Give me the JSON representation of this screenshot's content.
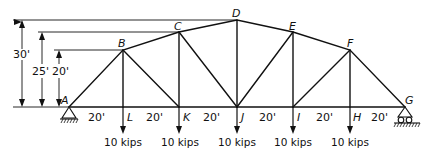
{
  "diagram": {
    "type": "truss",
    "nodes": {
      "A": {
        "label": "A",
        "x": 69,
        "y": 107
      },
      "L": {
        "label": "L",
        "x": 123,
        "y": 107
      },
      "K": {
        "label": "K",
        "x": 179,
        "y": 107
      },
      "J": {
        "label": "J",
        "x": 237,
        "y": 107
      },
      "I": {
        "label": "I",
        "x": 293,
        "y": 107
      },
      "H": {
        "label": "H",
        "x": 350,
        "y": 107
      },
      "G": {
        "label": "G",
        "x": 405,
        "y": 107
      },
      "B": {
        "label": "B",
        "x": 123,
        "y": 50
      },
      "C": {
        "label": "C",
        "x": 179,
        "y": 32
      },
      "D": {
        "label": "D",
        "x": 237,
        "y": 20
      },
      "E": {
        "label": "E",
        "x": 293,
        "y": 32
      },
      "F": {
        "label": "F",
        "x": 350,
        "y": 50
      }
    },
    "members": [
      [
        "A",
        "L"
      ],
      [
        "L",
        "K"
      ],
      [
        "K",
        "J"
      ],
      [
        "J",
        "I"
      ],
      [
        "I",
        "H"
      ],
      [
        "H",
        "G"
      ],
      [
        "A",
        "B"
      ],
      [
        "B",
        "C"
      ],
      [
        "C",
        "D"
      ],
      [
        "D",
        "E"
      ],
      [
        "E",
        "F"
      ],
      [
        "F",
        "G"
      ],
      [
        "B",
        "L"
      ],
      [
        "C",
        "K"
      ],
      [
        "D",
        "J"
      ],
      [
        "E",
        "I"
      ],
      [
        "F",
        "H"
      ],
      [
        "B",
        "K"
      ],
      [
        "C",
        "J"
      ],
      [
        "E",
        "J"
      ],
      [
        "F",
        "I"
      ]
    ],
    "panel_spacing_labels": [
      "20'",
      "20'",
      "20'",
      "20'",
      "20'",
      "20'"
    ],
    "height_dimensions": [
      {
        "label": "30'",
        "value_ft": 30,
        "to_node": "D"
      },
      {
        "label": "25'",
        "value_ft": 25,
        "to_node": "C"
      },
      {
        "label": "20'",
        "value_ft": 20,
        "to_node": "B"
      }
    ],
    "loads": [
      {
        "node": "L",
        "label": "10 kips"
      },
      {
        "node": "K",
        "label": "10 kips"
      },
      {
        "node": "J",
        "label": "10 kips"
      },
      {
        "node": "I",
        "label": "10 kips"
      },
      {
        "node": "H",
        "label": "10 kips"
      }
    ],
    "supports": [
      {
        "node": "A",
        "type": "pin"
      },
      {
        "node": "G",
        "type": "roller"
      }
    ],
    "line_color": "#111111"
  }
}
